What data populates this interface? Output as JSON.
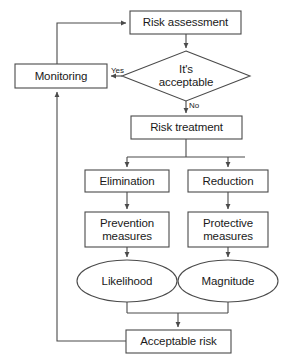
{
  "diagram": {
    "stroke_color": "#4a4a4a",
    "text_color": "#1a1a1a",
    "background_color": "#ffffff",
    "nodes": [
      {
        "id": "risk-assessment",
        "label": "Risk assessment",
        "shape": "rectangle"
      },
      {
        "id": "its-acceptable",
        "label": "It's\nacceptable",
        "shape": "diamond"
      },
      {
        "id": "monitoring",
        "label": "Monitoring",
        "shape": "rectangle"
      },
      {
        "id": "risk-treatment",
        "label": "Risk treatment",
        "shape": "rectangle"
      },
      {
        "id": "elimination",
        "label": "Elimination",
        "shape": "rectangle"
      },
      {
        "id": "reduction",
        "label": "Reduction",
        "shape": "rectangle"
      },
      {
        "id": "prevention-measures",
        "label": "Prevention\nmeasures",
        "shape": "rectangle"
      },
      {
        "id": "protective-measures",
        "label": "Protective\nmeasures",
        "shape": "rectangle"
      },
      {
        "id": "likelihood",
        "label": "Likelihood",
        "shape": "ellipse"
      },
      {
        "id": "magnitude",
        "label": "Magnitude",
        "shape": "ellipse"
      },
      {
        "id": "acceptable-risk",
        "label": "Acceptable risk",
        "shape": "rectangle"
      }
    ],
    "edge_labels": [
      {
        "id": "yes",
        "label": "Yes"
      },
      {
        "id": "no",
        "label": "No"
      }
    ]
  }
}
